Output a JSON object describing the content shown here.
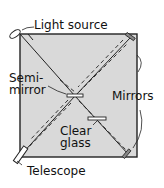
{
  "diagram": {
    "labels": {
      "light_source": "Light source",
      "semi_mirror_line1": "Semi-",
      "semi_mirror_line2": "mirror",
      "mirrors": "Mirrors",
      "clear_line1": "Clear",
      "clear_line2": "glass",
      "telescope": "Telescope"
    },
    "colors": {
      "box_fill": "#d9d9d9",
      "line": "#222222"
    }
  }
}
